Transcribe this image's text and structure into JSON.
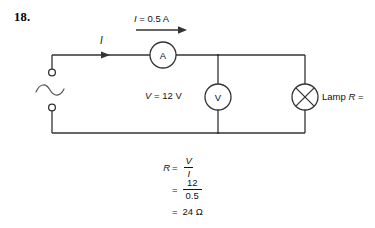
{
  "question": {
    "number": "18."
  },
  "diagram": {
    "current_label": "I = 0.5 A",
    "current_symbol": "I",
    "voltage_label": "V = 12 V",
    "ammeter_letter": "A",
    "voltmeter_letter": "V",
    "lamp_label": "Lamp R =",
    "source_type": "ac-source",
    "wire_color": "#333333"
  },
  "calculation": {
    "line1": {
      "lhs": "R",
      "eq": "=",
      "numerator": "V",
      "denominator": "I"
    },
    "line2": {
      "lhs": "",
      "eq": "=",
      "numerator": "12",
      "denominator": "0.5"
    },
    "line3": {
      "lhs": "",
      "eq": "=",
      "result": "24 Ω"
    }
  }
}
